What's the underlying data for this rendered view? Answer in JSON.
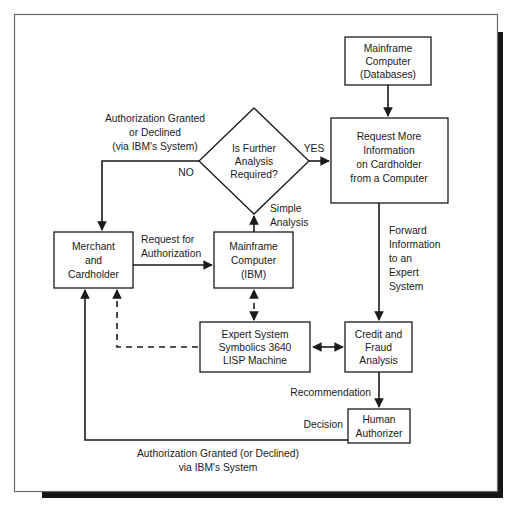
{
  "diagram": {
    "style": {
      "background": "#ffffff",
      "line_color": "#1a1a1a",
      "frame_color": "#6b6b6b",
      "shadow_color": "#161616"
    },
    "nodes": [
      {
        "id": "mainframe-databases",
        "shape": "rect",
        "lines": [
          "Mainframe",
          "Computer",
          "(Databases)"
        ],
        "x": 345,
        "y": 37,
        "w": 86,
        "h": 48
      },
      {
        "id": "request-more-info",
        "shape": "rect",
        "lines": [
          "Request More",
          "Information",
          "on Cardholder",
          "from a Computer"
        ],
        "x": 331,
        "y": 118,
        "w": 117,
        "h": 85
      },
      {
        "id": "is-further-analysis",
        "shape": "diamond",
        "lines": [
          "Is Further",
          "Analysis",
          "Required?"
        ],
        "cx": 254,
        "cy": 161,
        "rx": 55,
        "ry": 53
      },
      {
        "id": "merchant-cardholder",
        "shape": "rect",
        "lines": [
          "Merchant",
          "and",
          "Cardholder"
        ],
        "x": 54,
        "y": 232,
        "w": 79,
        "h": 56
      },
      {
        "id": "mainframe-ibm",
        "shape": "rect",
        "lines": [
          "Mainframe",
          "Computer",
          "(IBM)"
        ],
        "x": 214,
        "y": 232,
        "w": 79,
        "h": 56
      },
      {
        "id": "expert-system",
        "shape": "rect",
        "lines": [
          "Expert System",
          "Symbolics 3640",
          "LISP Machine"
        ],
        "x": 200,
        "y": 322,
        "w": 110,
        "h": 50
      },
      {
        "id": "credit-fraud-analysis",
        "shape": "rect",
        "lines": [
          "Credit and",
          "Fraud",
          "Analysis"
        ],
        "x": 345,
        "y": 322,
        "w": 67,
        "h": 50
      },
      {
        "id": "human-authorizer",
        "shape": "rect",
        "lines": [
          "Human",
          "Authorizer"
        ],
        "x": 348,
        "y": 409,
        "w": 62,
        "h": 34
      }
    ],
    "edge_labels": [
      {
        "id": "authorization-granted-declined",
        "lines": [
          "Authorization Granted",
          "or Declined",
          "(via IBM's System)"
        ],
        "x": 155,
        "y": 117,
        "anchor": "middle"
      },
      {
        "id": "no",
        "lines": [
          "NO"
        ],
        "x": 186,
        "y": 174,
        "anchor": "middle"
      },
      {
        "id": "yes",
        "lines": [
          "YES"
        ],
        "x": 312,
        "y": 149,
        "anchor": "middle"
      },
      {
        "id": "simple-analysis",
        "lines": [
          "Simple",
          "Analysis"
        ],
        "x": 271,
        "y": 207,
        "anchor": "start"
      },
      {
        "id": "request-for-authorization",
        "lines": [
          "Request for",
          "Authorization"
        ],
        "x": 141,
        "y": 238,
        "anchor": "start"
      },
      {
        "id": "forward-information",
        "lines": [
          "Forward",
          "Information",
          "to an",
          "Expert",
          "System"
        ],
        "x": 389,
        "y": 229,
        "anchor": "start"
      },
      {
        "id": "recommendation",
        "lines": [
          "Recommendation"
        ],
        "x": 339,
        "y": 392,
        "anchor": "end"
      },
      {
        "id": "decision",
        "lines": [
          "Decision"
        ],
        "x": 341,
        "y": 424,
        "anchor": "end"
      },
      {
        "id": "authorization-granted-via-ibm",
        "lines": [
          "Authorization Granted (or Declined)",
          "via IBM's System"
        ],
        "x": 218,
        "y": 453,
        "anchor": "middle"
      }
    ],
    "edges": [
      {
        "id": "databases-to-request",
        "from": "mainframe-databases",
        "to": "request-more-info",
        "style": "solid",
        "arrow": "end"
      },
      {
        "id": "decision-yes-to-request",
        "from": "is-further-analysis",
        "to": "request-more-info",
        "style": "solid",
        "arrow": "end",
        "label": "YES"
      },
      {
        "id": "decision-no-to-merchant",
        "from": "is-further-analysis",
        "to": "merchant-cardholder",
        "style": "solid",
        "arrow": "end",
        "label": "NO"
      },
      {
        "id": "mainframe-ibm-to-decision",
        "from": "mainframe-ibm",
        "to": "is-further-analysis",
        "style": "solid",
        "arrow": "end",
        "label": "Simple Analysis"
      },
      {
        "id": "merchant-to-mainframe-ibm",
        "from": "merchant-cardholder",
        "to": "mainframe-ibm",
        "style": "solid",
        "arrow": "end",
        "label": "Request for Authorization"
      },
      {
        "id": "request-to-credit-fraud",
        "from": "request-more-info",
        "to": "credit-fraud-analysis",
        "style": "solid",
        "arrow": "end",
        "label": "Forward Information to an Expert System"
      },
      {
        "id": "expert-system-credit-fraud",
        "from": "expert-system",
        "to": "credit-fraud-analysis",
        "style": "solid",
        "arrow": "both"
      },
      {
        "id": "expert-system-mainframe-ibm",
        "from": "expert-system",
        "to": "mainframe-ibm",
        "style": "dashed",
        "arrow": "both"
      },
      {
        "id": "expert-system-to-merchant",
        "from": "expert-system",
        "to": "merchant-cardholder",
        "style": "dashed",
        "arrow": "end"
      },
      {
        "id": "credit-fraud-to-human",
        "from": "credit-fraud-analysis",
        "to": "human-authorizer",
        "style": "solid",
        "arrow": "end",
        "label": "Recommendation"
      },
      {
        "id": "human-to-merchant",
        "from": "human-authorizer",
        "to": "merchant-cardholder",
        "style": "solid",
        "arrow": "end",
        "label": "Decision / Authorization Granted (or Declined) via IBM's System"
      }
    ]
  }
}
